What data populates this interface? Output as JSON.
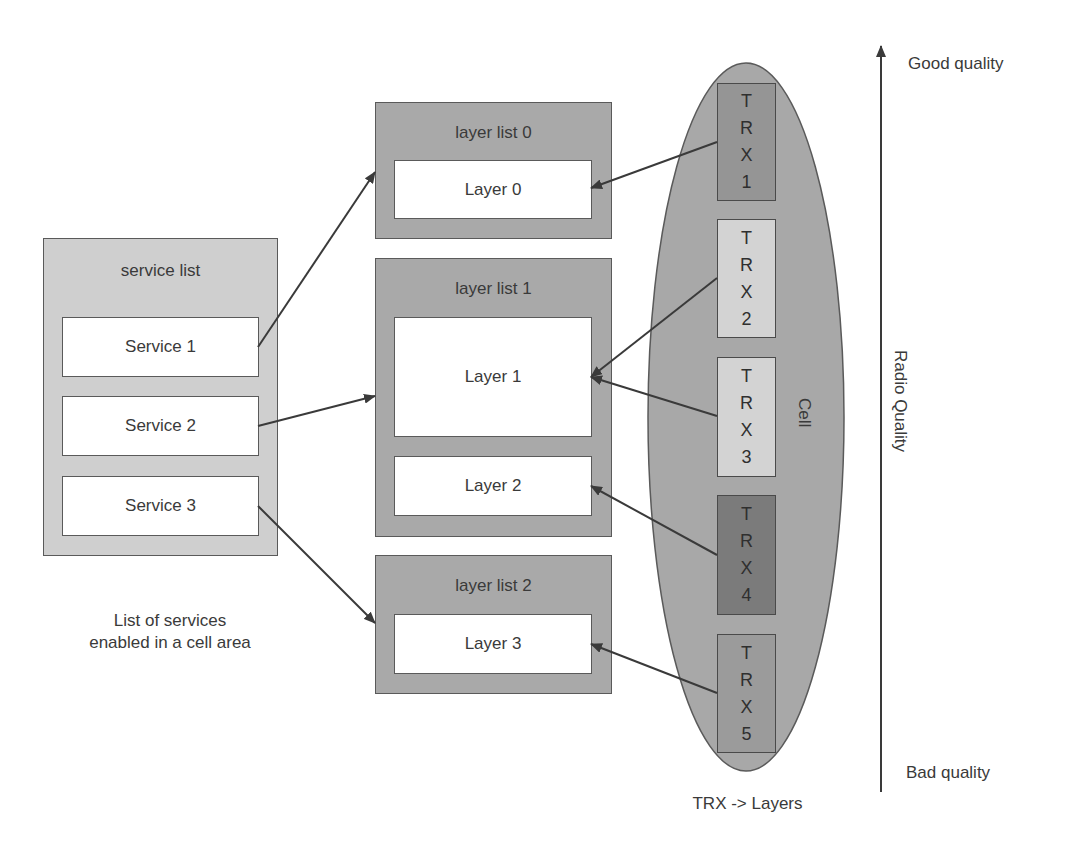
{
  "service_list": {
    "title": "service list",
    "items": [
      {
        "label": "Service 1"
      },
      {
        "label": "Service 2"
      },
      {
        "label": "Service 3"
      }
    ],
    "caption_line1": "List of services",
    "caption_line2": "enabled in a cell area"
  },
  "layer_lists": [
    {
      "title": "layer list 0",
      "layers": [
        "Layer 0"
      ]
    },
    {
      "title": "layer list 1",
      "layers": [
        "Layer 1",
        "Layer 2"
      ]
    },
    {
      "title": "layer list 2",
      "layers": [
        "Layer 3"
      ]
    }
  ],
  "cell": {
    "label": "Cell",
    "caption": "TRX -> Layers",
    "trx": [
      {
        "chars": [
          "T",
          "R",
          "X",
          "1"
        ],
        "color": "#959595"
      },
      {
        "chars": [
          "T",
          "R",
          "X",
          "2"
        ],
        "color": "#d3d3d3"
      },
      {
        "chars": [
          "T",
          "R",
          "X",
          "3"
        ],
        "color": "#d3d3d3"
      },
      {
        "chars": [
          "T",
          "R",
          "X",
          "4"
        ],
        "color": "#7b7b7b"
      },
      {
        "chars": [
          "T",
          "R",
          "X",
          "5"
        ],
        "color": "#9b9b9b"
      }
    ]
  },
  "quality_axis": {
    "title": "Radio Quality",
    "top_label": "Good quality",
    "bottom_label": "Bad quality"
  },
  "mappings": {
    "service_to_layer_list": [
      {
        "from": "Service 1",
        "to": "layer list 0"
      },
      {
        "from": "Service 2",
        "to": "layer list 1"
      },
      {
        "from": "Service 3",
        "to": "layer list 2"
      }
    ],
    "trx_to_layer": [
      {
        "from": "TRX 1",
        "to": "Layer 0"
      },
      {
        "from": "TRX 2",
        "to": "Layer 1"
      },
      {
        "from": "TRX 3",
        "to": "Layer 1"
      },
      {
        "from": "TRX 4",
        "to": "Layer 2"
      },
      {
        "from": "TRX 5",
        "to": "Layer 3"
      }
    ]
  },
  "colors": {
    "service_list_fill": "#cfcfcf",
    "layer_list_fill": "#a9a9a9",
    "cell_fill": "#a8a8a8",
    "stroke": "#4a4a4a"
  }
}
